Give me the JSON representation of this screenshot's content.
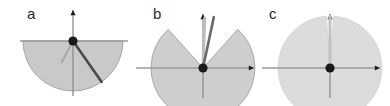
{
  "figure": {
    "type": "vector-diagram",
    "background_color": "#ffffff",
    "width": 390,
    "height": 106,
    "panels": [
      {
        "id": "a",
        "label": "a",
        "label_pos": {
          "x": 27,
          "y": 19
        },
        "origin": {
          "x": 73,
          "y": 41
        },
        "axes": {
          "vertical": {
            "x": 73,
            "y_top": 10,
            "y_bottom": 96,
            "arrow": "up",
            "color": "#8c8c8c"
          },
          "horizontal": {
            "y": 41,
            "x_left": 20,
            "x_right": 128,
            "arrow": "right",
            "color": "#9a9a9a"
          }
        },
        "region": {
          "shape": "semicircle",
          "radius": 50,
          "start_angle_deg": 180,
          "end_angle_deg": 360,
          "orientation": "downward",
          "fill": "#c9c9c9",
          "stroke": "#a0a0a0"
        },
        "needles": [
          {
            "name": "primary-needle",
            "angle_deg": -55,
            "length": 50,
            "color": "#4a4a4a",
            "width": 2.6
          },
          {
            "name": "secondary-needle",
            "angle_deg": -118,
            "length": 24,
            "color": "#a8a8a8",
            "width": 2.0
          }
        ],
        "origin_dot": {
          "radius": 4.6,
          "color": "#1a1a1a"
        }
      },
      {
        "id": "b",
        "label": "b",
        "label_pos": {
          "x": 153,
          "y": 19
        },
        "origin": {
          "x": 203,
          "y": 68
        },
        "axes": {
          "vertical": {
            "x": 203,
            "y_top": 14,
            "y_bottom": 98,
            "arrow": "up",
            "color": "#8c8c8c"
          },
          "horizontal": {
            "y": 68,
            "x_left": 136,
            "x_right": 254,
            "arrow": "right",
            "color": "#9a9a9a"
          }
        },
        "region": {
          "shape": "sector",
          "radius": 52,
          "start_angle_deg": 132,
          "end_angle_deg": 48,
          "orientation": "upward",
          "fill": "#cecece",
          "stroke": "#a4a4a4"
        },
        "needles": [
          {
            "name": "primary-needle",
            "angle_deg": 78,
            "length": 52,
            "color": "#6b6b6b",
            "width": 2.6
          },
          {
            "name": "secondary-needle",
            "angle_deg": 88,
            "length": 50,
            "color": "#bdbdbd",
            "width": 3.0
          }
        ],
        "origin_dot": {
          "radius": 4.6,
          "color": "#1a1a1a"
        }
      },
      {
        "id": "c",
        "label": "c",
        "label_pos": {
          "x": 269,
          "y": 19
        },
        "origin": {
          "x": 330,
          "y": 68
        },
        "axes": {
          "vertical": {
            "x": 330,
            "y_top": 14,
            "y_bottom": 98,
            "arrow": "up",
            "color": "#8c8c8c"
          },
          "horizontal": {
            "y": 68,
            "x_left": 262,
            "x_right": 380,
            "arrow": "right",
            "color": "#9a9a9a"
          }
        },
        "region": {
          "shape": "band",
          "radius": 52,
          "start_angle_deg": 94,
          "end_angle_deg": 86,
          "orientation": "upward",
          "fill": "#dcdcdc",
          "stroke": "#d2d2d2"
        },
        "needles": [
          {
            "name": "primary-needle",
            "angle_deg": 90,
            "length": 52,
            "color": "#c2c2c2",
            "width": 3.0
          }
        ],
        "origin_dot": {
          "radius": 4.6,
          "color": "#1a1a1a"
        }
      }
    ]
  }
}
